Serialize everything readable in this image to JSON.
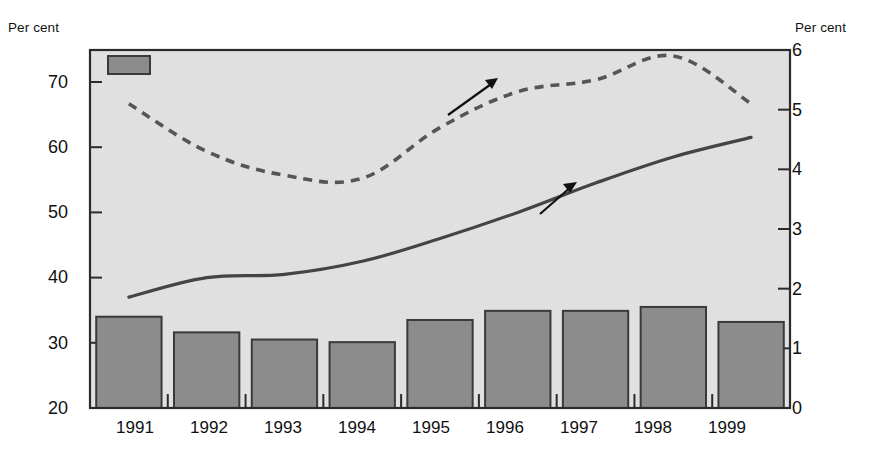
{
  "axes": {
    "left_unit_label": "Per cent",
    "right_unit_label": "Per cent",
    "left_ticks": [
      "70",
      "60",
      "50",
      "40",
      "30",
      "20"
    ],
    "right_ticks": [
      "6",
      "5",
      "4",
      "3",
      "2",
      "1",
      "0"
    ]
  },
  "legend": {
    "bar_label": "Tax value of interest payments (right scale)",
    "swatch_color": "#8c8c8c"
  },
  "annotations": {
    "interest": "Interest payments (right scale)",
    "debt": "Debt (left scale)"
  },
  "chart_data": {
    "type": "bar",
    "title": "",
    "xlabel": "",
    "ylabel": "Per cent",
    "categories": [
      "1991",
      "1992",
      "1993",
      "1994",
      "1995",
      "1996",
      "1997",
      "1998",
      "1999"
    ],
    "grid": false,
    "legend_position": "top-left",
    "left_axis": {
      "label": "Per cent",
      "ylim": [
        20,
        75
      ],
      "ticks": [
        20,
        30,
        40,
        50,
        60,
        70
      ]
    },
    "right_axis": {
      "label": "Per cent",
      "ylim": [
        0,
        6
      ],
      "ticks": [
        0,
        1,
        2,
        3,
        4,
        5,
        6
      ]
    },
    "series": [
      {
        "name": "Tax value of interest payments (right scale)",
        "type": "bar",
        "axis": "right",
        "color": "#8c8c8c",
        "values_left_scale": [
          34.0,
          31.6,
          30.5,
          30.1,
          33.5,
          34.9,
          34.9,
          35.5,
          33.2
        ],
        "values": [
          1.53,
          1.27,
          1.15,
          1.11,
          1.48,
          1.63,
          1.63,
          1.7,
          1.44
        ]
      },
      {
        "name": "Debt (left scale)",
        "type": "line",
        "axis": "left",
        "style": "solid",
        "color": "#444444",
        "values": [
          37.0,
          40.0,
          40.5,
          42.5,
          46.0,
          50.0,
          54.5,
          58.5,
          61.5
        ]
      },
      {
        "name": "Interest payments (right scale)",
        "type": "line",
        "axis": "right",
        "style": "dashed",
        "color": "#555555",
        "values": [
          5.1,
          4.3,
          3.9,
          3.85,
          4.7,
          5.3,
          5.5,
          5.9,
          5.1
        ]
      }
    ]
  },
  "style": {
    "plot_background": "#e0e0e0",
    "plot_border": "#2b2b2b",
    "bar_fill": "#8c8c8c",
    "bar_stroke": "#3a3a3a"
  }
}
